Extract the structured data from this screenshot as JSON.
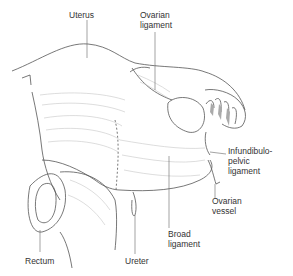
{
  "figure": {
    "labels": {
      "uterus": "Uterus",
      "ovarian_ligament": "Ovarian\nligament",
      "infundibulopelvic_ligament": "Infundibulo-\npelvic\nligament",
      "ovarian_vessel": "Ovarian\nvessel",
      "broad_ligament": "Broad\nligament",
      "rectum": "Rectum",
      "ureter": "Ureter"
    },
    "colors": {
      "line": "#555555",
      "fill": "#ffffff",
      "shade": "#bbbbbb"
    }
  }
}
